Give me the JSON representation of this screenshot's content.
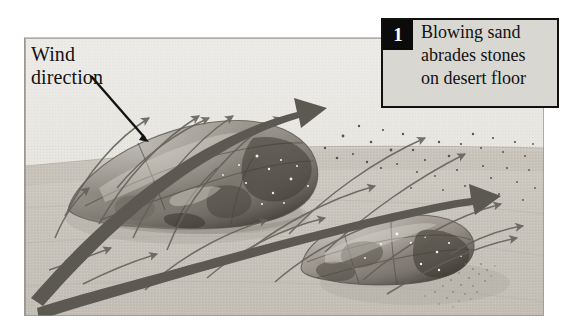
{
  "figure": {
    "name": "ventifact-formation-stage-1",
    "background_color": "#ffffff",
    "width": 583,
    "height": 333
  },
  "illustration": {
    "name": "desert-abrasion-illustration",
    "sky_color": "#e6e4e0",
    "ground_color": "#c9c5bd",
    "rock_color": "#8d8880",
    "arrow_color": "#595651",
    "thin_arrow_color": "#6f6b66",
    "pointer_color": "#141414",
    "horizon_label": "desert floor horizon"
  },
  "labels": {
    "wind_direction": "Wind\ndirection"
  },
  "caption": {
    "number": "1",
    "text": "Blowing sand\nabrades stones\non desert floor",
    "line1": "Blowing sand",
    "line2": "abrades stones",
    "line3": "on desert floor",
    "box_fill": "#d9d7d2",
    "box_border": "#111111",
    "number_fill": "#0b0b0b"
  },
  "elements": {
    "large_stone": "large abraded stone",
    "small_stone": "smaller abraded stone",
    "wind_arrow_upper": "upper wind flow arrow",
    "wind_arrow_lower": "lower wind flow arrow",
    "saltation_arrows": "sand grain trajectory arrows",
    "sand_grains": "blowing sand grains",
    "pointer_line": "wind direction pointer line"
  }
}
